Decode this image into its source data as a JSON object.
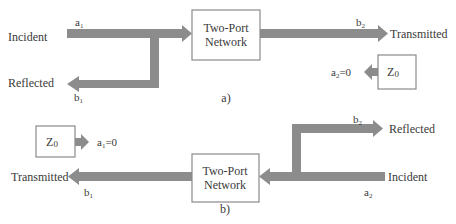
{
  "colors": {
    "arrow": "#8c8c8c",
    "box_stroke": "#8a8a8a",
    "text": "#3a3a3a",
    "background": "#ffffff"
  },
  "panel_a": {
    "caption": "a)",
    "network_box": {
      "line1": "Two-Port",
      "line2": "Network"
    },
    "load_box": {
      "label": "Z",
      "subscript": "0"
    },
    "labels": {
      "incident": "Incident",
      "reflected": "Reflected",
      "transmitted": "Transmitted"
    },
    "waves": {
      "a1": {
        "base": "a",
        "sub": "1"
      },
      "b1": {
        "base": "b",
        "sub": "1"
      },
      "b2": {
        "base": "b",
        "sub": "2"
      },
      "a2": {
        "base": "a",
        "sub": "2",
        "suffix": "=0"
      }
    }
  },
  "panel_b": {
    "caption": "b)",
    "network_box": {
      "line1": "Two-Port",
      "line2": "Network"
    },
    "load_box": {
      "label": "Z",
      "subscript": "0"
    },
    "labels": {
      "incident": "Incident",
      "reflected": "Reflected",
      "transmitted": "Transmitted"
    },
    "waves": {
      "a1": {
        "base": "a",
        "sub": "1",
        "suffix": "=0"
      },
      "b1": {
        "base": "b",
        "sub": "1"
      },
      "b2": {
        "base": "b",
        "sub": "2"
      },
      "a2": {
        "base": "a",
        "sub": "2"
      }
    }
  }
}
